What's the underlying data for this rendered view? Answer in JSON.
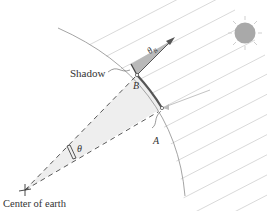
{
  "diagram": {
    "labels": {
      "shadow": "Shadow",
      "point_a": "A",
      "point_b": "B",
      "angle_center": "θ",
      "angle_b": "θ",
      "angle_b_sub": "B",
      "center": "Center of earth"
    },
    "colors": {
      "earth_outline": "#9a9a9a",
      "sun_rays": "#c8c8c8",
      "sun_fill": "#a9a9a9",
      "arc_ab": "#555555",
      "wedge_fill": "#eeeeee",
      "shadow_fill": "#b9b9b9",
      "dashed": "#444444"
    }
  }
}
